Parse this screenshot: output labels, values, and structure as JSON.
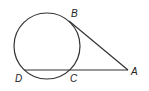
{
  "diagram": {
    "type": "geometry",
    "circle": {
      "cx": 47,
      "cy": 46,
      "r": 33
    },
    "points": {
      "A": {
        "label": "A",
        "x": 128,
        "y": 70
      },
      "B": {
        "label": "B",
        "x": 69,
        "y": 21
      },
      "C": {
        "label": "C",
        "x": 70,
        "y": 70
      },
      "D": {
        "label": "D",
        "x": 24,
        "y": 70
      }
    },
    "segments": [
      {
        "from": "A",
        "to": "B",
        "kind": "tangent"
      },
      {
        "from": "A",
        "to": "D",
        "kind": "secant"
      }
    ],
    "stroke_color": "#333333"
  }
}
